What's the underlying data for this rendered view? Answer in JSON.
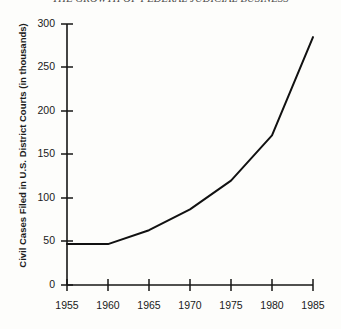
{
  "chart_data": {
    "type": "line",
    "title": "THE GROWTH OF FEDERAL JUDICIAL BUSINESS",
    "xlabel": "",
    "ylabel": "Civil Cases Filed in U.S. District Courts (in thousands)",
    "x": [
      1955,
      1960,
      1965,
      1970,
      1975,
      1980,
      1985
    ],
    "values": [
      47,
      47,
      63,
      87,
      120,
      172,
      285
    ],
    "series": [
      {
        "name": "Civil cases filed",
        "values": [
          47,
          47,
          63,
          87,
          120,
          172,
          285
        ]
      }
    ],
    "xticks": [
      "1955",
      "1960",
      "1965",
      "1970",
      "1975",
      "1980",
      "1985"
    ],
    "yticks": [
      "0",
      "50",
      "100",
      "150",
      "200",
      "250",
      "300"
    ],
    "xlim": [
      1955,
      1985
    ],
    "ylim": [
      0,
      300
    ],
    "grid": false,
    "legend": false,
    "line_color": "#111111"
  },
  "figure": {
    "background": "#fdfdfb",
    "ink_color": "#161616"
  }
}
